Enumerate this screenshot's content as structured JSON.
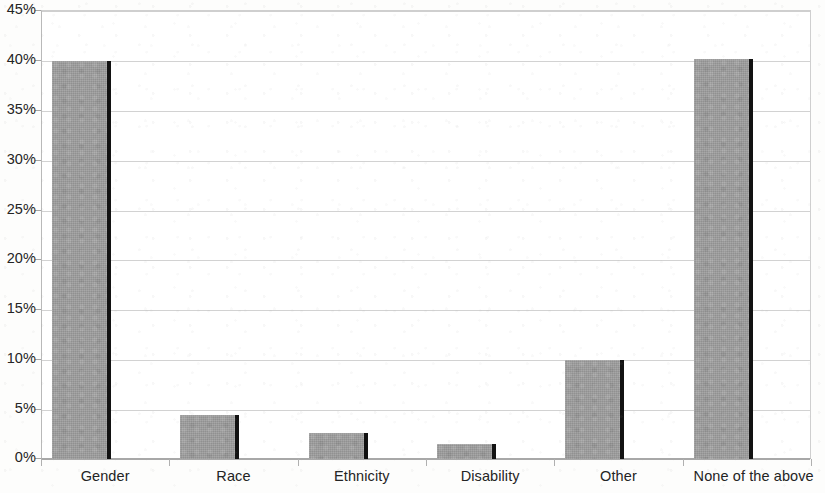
{
  "chart_data": {
    "type": "bar",
    "title": "",
    "subtitle": "",
    "xlabel": "",
    "ylabel": "",
    "categories": [
      "Gender",
      "Race",
      "Ethnicity",
      "Disability",
      "Other",
      "None of the above"
    ],
    "values": [
      39.9,
      4.4,
      2.6,
      1.5,
      9.9,
      40.1
    ],
    "series": [
      {
        "name": "",
        "values": [
          39.9,
          4.4,
          2.6,
          1.5,
          9.9,
          40.1
        ]
      }
    ],
    "ylim": [
      0,
      45
    ],
    "ytick_values": [
      0,
      5,
      10,
      15,
      20,
      25,
      30,
      35,
      40,
      45
    ],
    "ytick_labels": [
      "0%",
      "5%",
      "10%",
      "15%",
      "20%",
      "25%",
      "30%",
      "35%",
      "40%",
      "45%"
    ],
    "grid": true,
    "grid_axis": "y",
    "legend": false,
    "legend_position": "none",
    "annotations": [],
    "colors": {
      "bar_fill": "#9d9d9d",
      "bar_edge": "#121212",
      "gridline": "#d2d2d2",
      "axis": "#a8a8a8",
      "text": "#242424",
      "background": "#ffffff"
    }
  }
}
